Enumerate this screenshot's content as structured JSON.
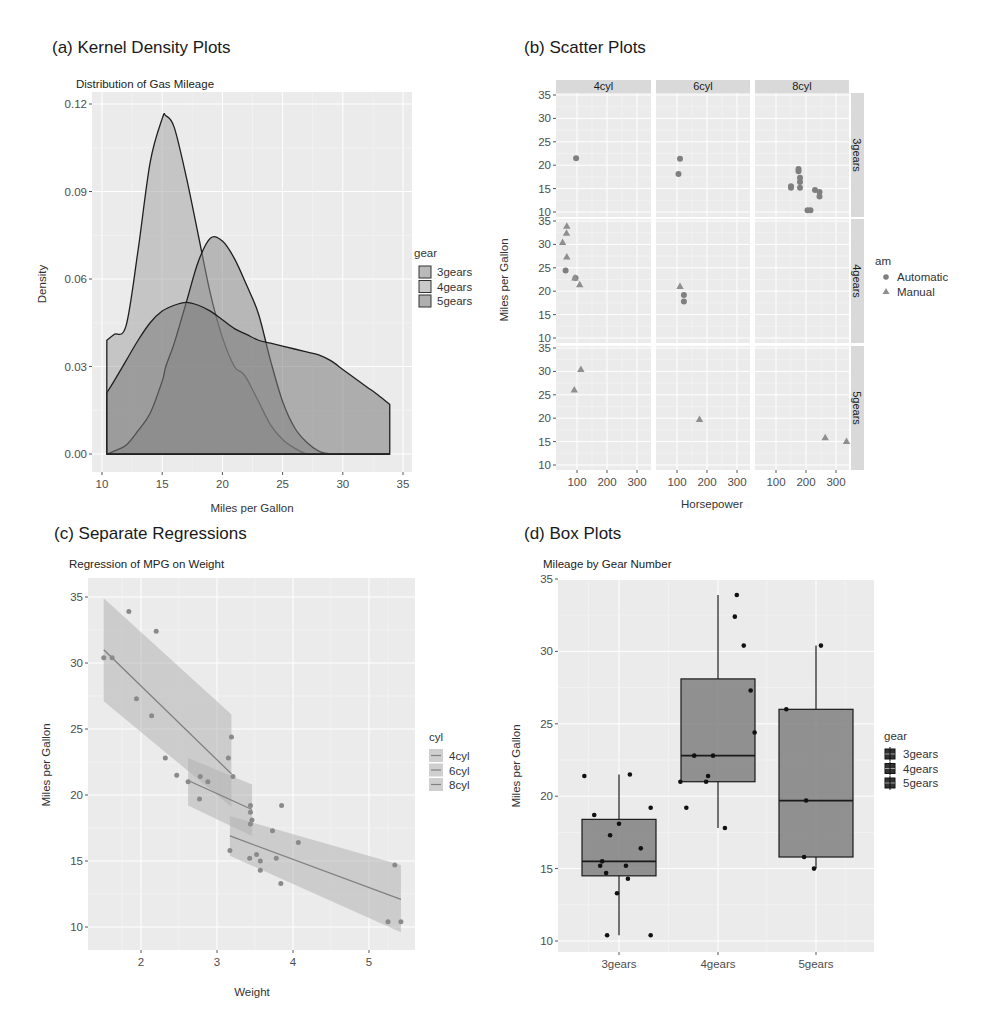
{
  "panels": {
    "a": {
      "label": "(a) Kernel Density Plots",
      "subtitle": "Distribution of Gas Mileage"
    },
    "b": {
      "label": "(b) Scatter Plots"
    },
    "c": {
      "label": "(c) Separate Regressions",
      "subtitle": "Regression of MPG on Weight"
    },
    "d": {
      "label": "(d) Box Plots",
      "subtitle": "Mileage by Gear Number"
    }
  },
  "colors": {
    "panel_bg": "#ebebeb",
    "grid": "#ffffff",
    "fill_3gears": "#8c8c8c",
    "fill_4gears": "#a6a6a6",
    "fill_5gears": "#7a7a7a",
    "point": "#7f7f7f",
    "box_fill": "#808080",
    "band": "#b3b3b3"
  },
  "chart_data": [
    {
      "id": "a",
      "type": "area",
      "title": "Distribution of Gas Mileage",
      "xlabel": "Miles per Gallon",
      "ylabel": "Density",
      "xlim": [
        10,
        35
      ],
      "ylim": [
        0,
        0.12
      ],
      "xticks": [
        10,
        15,
        20,
        25,
        30,
        35
      ],
      "yticks": [
        "0.00",
        "0.03",
        "0.06",
        "0.09",
        "0.12"
      ],
      "legend": {
        "title": "gear",
        "entries": [
          "3gears",
          "4gears",
          "5gears"
        ],
        "position": "right"
      },
      "series": [
        {
          "name": "3gears",
          "x": [
            10.4,
            11,
            12,
            13,
            14,
            15,
            15.3,
            16,
            17,
            18,
            19,
            20,
            21,
            22,
            23,
            24,
            25,
            26,
            27,
            28,
            29,
            30,
            31,
            32,
            33,
            33.9
          ],
          "y": [
            0,
            0.001,
            0.003,
            0.008,
            0.014,
            0.025,
            0.03,
            0.038,
            0.052,
            0.066,
            0.074,
            0.073,
            0.067,
            0.058,
            0.048,
            0.032,
            0.018,
            0.009,
            0.004,
            0.001,
            0,
            0,
            0,
            0,
            0,
            0
          ]
        },
        {
          "name": "4gears",
          "x": [
            10.4,
            11,
            12,
            13,
            14,
            15,
            15.3,
            16,
            17,
            18,
            19,
            20,
            21,
            21.6,
            22,
            23,
            24,
            25,
            26,
            27,
            28,
            29,
            30,
            31,
            32,
            33,
            33.9
          ],
          "y": [
            0.039,
            0.041,
            0.044,
            0.07,
            0.1,
            0.115,
            0.116,
            0.112,
            0.095,
            0.075,
            0.055,
            0.04,
            0.03,
            0.028,
            0.026,
            0.018,
            0.01,
            0.005,
            0.002,
            0,
            0,
            0,
            0,
            0,
            0,
            0,
            0
          ]
        },
        {
          "name": "5gears",
          "x": [
            10.4,
            11,
            12,
            13,
            14,
            15,
            16,
            17,
            18,
            19,
            20,
            21,
            22,
            23,
            24,
            25,
            26,
            27,
            28,
            29,
            30,
            31,
            32,
            33,
            33.9
          ],
          "y": [
            0.021,
            0.025,
            0.032,
            0.039,
            0.045,
            0.049,
            0.051,
            0.052,
            0.051,
            0.049,
            0.046,
            0.043,
            0.041,
            0.039,
            0.038,
            0.037,
            0.036,
            0.035,
            0.034,
            0.032,
            0.029,
            0.026,
            0.023,
            0.02,
            0.017
          ]
        }
      ],
      "overlay_curves": {
        "3gears_smooth_peak": {
          "x": 21.5,
          "y": 0.077
        },
        "4gears_peak": {
          "x": 15.3,
          "y": 0.116
        },
        "5gears_peak": {
          "x": 17.2,
          "y": 0.052
        }
      }
    },
    {
      "id": "b",
      "type": "scatter",
      "xlabel": "Horsepower",
      "ylabel": "Miles per Gallon",
      "xticks": [
        100,
        200,
        300
      ],
      "yticks": [
        10,
        15,
        20,
        25,
        30,
        35
      ],
      "facet_cols": [
        "4cyl",
        "6cyl",
        "8cyl"
      ],
      "facet_rows": [
        "3gears",
        "4gears",
        "5gears"
      ],
      "legend": {
        "title": "am",
        "entries": [
          "Automatic",
          "Manual"
        ],
        "position": "right"
      },
      "points": [
        {
          "cyl": "4cyl",
          "gear": "3gears",
          "hp": 97,
          "mpg": 21.5,
          "am": "Automatic"
        },
        {
          "cyl": "6cyl",
          "gear": "3gears",
          "hp": 110,
          "mpg": 21.4,
          "am": "Automatic"
        },
        {
          "cyl": "6cyl",
          "gear": "3gears",
          "hp": 105,
          "mpg": 18.1,
          "am": "Automatic"
        },
        {
          "cyl": "8cyl",
          "gear": "3gears",
          "hp": 175,
          "mpg": 18.7,
          "am": "Automatic"
        },
        {
          "cyl": "8cyl",
          "gear": "3gears",
          "hp": 175,
          "mpg": 19.2,
          "am": "Automatic"
        },
        {
          "cyl": "8cyl",
          "gear": "3gears",
          "hp": 180,
          "mpg": 17.3,
          "am": "Automatic"
        },
        {
          "cyl": "8cyl",
          "gear": "3gears",
          "hp": 180,
          "mpg": 16.4,
          "am": "Automatic"
        },
        {
          "cyl": "8cyl",
          "gear": "3gears",
          "hp": 180,
          "mpg": 15.2,
          "am": "Automatic"
        },
        {
          "cyl": "8cyl",
          "gear": "3gears",
          "hp": 150,
          "mpg": 15.5,
          "am": "Automatic"
        },
        {
          "cyl": "8cyl",
          "gear": "3gears",
          "hp": 150,
          "mpg": 15.2,
          "am": "Automatic"
        },
        {
          "cyl": "8cyl",
          "gear": "3gears",
          "hp": 205,
          "mpg": 10.4,
          "am": "Automatic"
        },
        {
          "cyl": "8cyl",
          "gear": "3gears",
          "hp": 215,
          "mpg": 10.4,
          "am": "Automatic"
        },
        {
          "cyl": "8cyl",
          "gear": "3gears",
          "hp": 230,
          "mpg": 14.7,
          "am": "Automatic"
        },
        {
          "cyl": "8cyl",
          "gear": "3gears",
          "hp": 245,
          "mpg": 14.3,
          "am": "Automatic"
        },
        {
          "cyl": "8cyl",
          "gear": "3gears",
          "hp": 245,
          "mpg": 13.3,
          "am": "Automatic"
        },
        {
          "cyl": "4cyl",
          "gear": "4gears",
          "hp": 62,
          "mpg": 24.4,
          "am": "Automatic"
        },
        {
          "cyl": "4cyl",
          "gear": "4gears",
          "hp": 95,
          "mpg": 22.8,
          "am": "Automatic"
        },
        {
          "cyl": "4cyl",
          "gear": "4gears",
          "hp": 66,
          "mpg": 33.9,
          "am": "Manual"
        },
        {
          "cyl": "4cyl",
          "gear": "4gears",
          "hp": 65,
          "mpg": 32.4,
          "am": "Manual"
        },
        {
          "cyl": "4cyl",
          "gear": "4gears",
          "hp": 52,
          "mpg": 30.4,
          "am": "Manual"
        },
        {
          "cyl": "4cyl",
          "gear": "4gears",
          "hp": 66,
          "mpg": 27.3,
          "am": "Manual"
        },
        {
          "cyl": "4cyl",
          "gear": "4gears",
          "hp": 93,
          "mpg": 22.8,
          "am": "Manual"
        },
        {
          "cyl": "4cyl",
          "gear": "4gears",
          "hp": 109,
          "mpg": 21.4,
          "am": "Manual"
        },
        {
          "cyl": "6cyl",
          "gear": "4gears",
          "hp": 110,
          "mpg": 21.0,
          "am": "Manual"
        },
        {
          "cyl": "6cyl",
          "gear": "4gears",
          "hp": 123,
          "mpg": 19.2,
          "am": "Automatic"
        },
        {
          "cyl": "6cyl",
          "gear": "4gears",
          "hp": 123,
          "mpg": 17.8,
          "am": "Automatic"
        },
        {
          "cyl": "4cyl",
          "gear": "5gears",
          "hp": 91,
          "mpg": 26.0,
          "am": "Manual"
        },
        {
          "cyl": "4cyl",
          "gear": "5gears",
          "hp": 113,
          "mpg": 30.4,
          "am": "Manual"
        },
        {
          "cyl": "6cyl",
          "gear": "5gears",
          "hp": 175,
          "mpg": 19.7,
          "am": "Manual"
        },
        {
          "cyl": "8cyl",
          "gear": "5gears",
          "hp": 264,
          "mpg": 15.8,
          "am": "Manual"
        },
        {
          "cyl": "8cyl",
          "gear": "5gears",
          "hp": 335,
          "mpg": 15.0,
          "am": "Manual"
        }
      ]
    },
    {
      "id": "c",
      "type": "scatter",
      "title": "Regression of MPG on Weight",
      "xlabel": "Weight",
      "ylabel": "Miles per Gallon",
      "xlim": [
        1.35,
        5.6
      ],
      "ylim": [
        8.3,
        36.2
      ],
      "xticks": [
        2,
        3,
        4,
        5
      ],
      "yticks": [
        10,
        15,
        20,
        25,
        30,
        35
      ],
      "legend": {
        "title": "cyl",
        "entries": [
          "4cyl",
          "6cyl",
          "8cyl"
        ],
        "position": "right"
      },
      "points": [
        {
          "wt": 1.51,
          "mpg": 30.4
        },
        {
          "wt": 1.62,
          "mpg": 30.4
        },
        {
          "wt": 1.84,
          "mpg": 33.9
        },
        {
          "wt": 1.94,
          "mpg": 27.3
        },
        {
          "wt": 2.14,
          "mpg": 26.0
        },
        {
          "wt": 2.2,
          "mpg": 32.4
        },
        {
          "wt": 2.32,
          "mpg": 22.8
        },
        {
          "wt": 2.47,
          "mpg": 21.5
        },
        {
          "wt": 3.15,
          "mpg": 22.8
        },
        {
          "wt": 3.19,
          "mpg": 24.4
        },
        {
          "wt": 3.21,
          "mpg": 21.4
        },
        {
          "wt": 2.62,
          "mpg": 21.0
        },
        {
          "wt": 2.77,
          "mpg": 19.7
        },
        {
          "wt": 2.78,
          "mpg": 21.4
        },
        {
          "wt": 2.88,
          "mpg": 21.0
        },
        {
          "wt": 3.44,
          "mpg": 19.2
        },
        {
          "wt": 3.44,
          "mpg": 18.7
        },
        {
          "wt": 3.46,
          "mpg": 18.1
        },
        {
          "wt": 3.44,
          "mpg": 17.8
        },
        {
          "wt": 3.17,
          "mpg": 15.8
        },
        {
          "wt": 3.43,
          "mpg": 15.2
        },
        {
          "wt": 3.52,
          "mpg": 15.5
        },
        {
          "wt": 3.57,
          "mpg": 15.0
        },
        {
          "wt": 3.57,
          "mpg": 14.3
        },
        {
          "wt": 3.73,
          "mpg": 17.3
        },
        {
          "wt": 3.78,
          "mpg": 15.2
        },
        {
          "wt": 3.84,
          "mpg": 13.3
        },
        {
          "wt": 3.85,
          "mpg": 19.2
        },
        {
          "wt": 4.07,
          "mpg": 16.4
        },
        {
          "wt": 5.25,
          "mpg": 10.4
        },
        {
          "wt": 5.34,
          "mpg": 14.7
        },
        {
          "wt": 5.42,
          "mpg": 10.4
        }
      ],
      "fits": [
        {
          "name": "4cyl",
          "x": [
            1.51,
            3.19
          ],
          "y": [
            31.0,
            21.6
          ],
          "band_lower": [
            27.1,
            19.1
          ],
          "band_upper": [
            34.9,
            26.1
          ]
        },
        {
          "name": "6cyl",
          "x": [
            2.62,
            3.46
          ],
          "y": [
            21.1,
            18.9
          ],
          "band_lower": [
            19.2,
            16.9
          ],
          "band_upper": [
            22.8,
            20.8
          ]
        },
        {
          "name": "8cyl",
          "x": [
            3.17,
            5.42
          ],
          "y": [
            16.9,
            12.1
          ],
          "band_lower": [
            15.4,
            9.6
          ],
          "band_upper": [
            18.4,
            14.7
          ]
        }
      ]
    },
    {
      "id": "d",
      "type": "box",
      "title": "Mileage by Gear Number",
      "xlabel": "",
      "ylabel": "Miles per Gallon",
      "ylim": [
        9.2,
        35.2
      ],
      "yticks": [
        10,
        15,
        20,
        25,
        30,
        35
      ],
      "categories": [
        "3gears",
        "4gears",
        "5gears"
      ],
      "legend": {
        "title": "gear",
        "entries": [
          "3gears",
          "4gears",
          "5gears"
        ],
        "position": "right"
      },
      "boxes": [
        {
          "name": "3gears",
          "min": 10.4,
          "q1": 14.5,
          "median": 15.5,
          "q3": 18.4,
          "max": 21.5
        },
        {
          "name": "4gears",
          "min": 17.8,
          "q1": 21.0,
          "median": 22.8,
          "q3": 28.1,
          "max": 33.9
        },
        {
          "name": "5gears",
          "min": 15.0,
          "q1": 15.8,
          "median": 19.7,
          "q3": 26.0,
          "max": 30.4
        }
      ],
      "jitter_points": [
        {
          "cat": 0,
          "dx": -0.35,
          "mpg": 21.4
        },
        {
          "cat": 0,
          "dx": -0.25,
          "mpg": 18.7
        },
        {
          "cat": 0,
          "dx": -0.09,
          "mpg": 17.3
        },
        {
          "cat": 0,
          "dx": 0.0,
          "mpg": 18.1
        },
        {
          "cat": 0,
          "dx": 0.11,
          "mpg": 21.5
        },
        {
          "cat": 0,
          "dx": 0.32,
          "mpg": 19.2
        },
        {
          "cat": 0,
          "dx": 0.22,
          "mpg": 16.4
        },
        {
          "cat": 0,
          "dx": -0.17,
          "mpg": 15.5
        },
        {
          "cat": 0,
          "dx": -0.19,
          "mpg": 15.2
        },
        {
          "cat": 0,
          "dx": 0.07,
          "mpg": 15.2
        },
        {
          "cat": 0,
          "dx": -0.13,
          "mpg": 14.7
        },
        {
          "cat": 0,
          "dx": 0.09,
          "mpg": 14.3
        },
        {
          "cat": 0,
          "dx": -0.02,
          "mpg": 13.3
        },
        {
          "cat": 0,
          "dx": -0.12,
          "mpg": 10.4
        },
        {
          "cat": 0,
          "dx": 0.32,
          "mpg": 10.4
        },
        {
          "cat": 1,
          "dx": 0.19,
          "mpg": 33.9
        },
        {
          "cat": 1,
          "dx": 0.17,
          "mpg": 32.4
        },
        {
          "cat": 1,
          "dx": 0.26,
          "mpg": 30.4
        },
        {
          "cat": 1,
          "dx": 0.33,
          "mpg": 27.3
        },
        {
          "cat": 1,
          "dx": 0.37,
          "mpg": 24.4
        },
        {
          "cat": 1,
          "dx": -0.24,
          "mpg": 22.8
        },
        {
          "cat": 1,
          "dx": -0.05,
          "mpg": 22.8
        },
        {
          "cat": 1,
          "dx": -0.1,
          "mpg": 21.4
        },
        {
          "cat": 1,
          "dx": -0.38,
          "mpg": 21.0
        },
        {
          "cat": 1,
          "dx": -0.12,
          "mpg": 21.0
        },
        {
          "cat": 1,
          "dx": -0.32,
          "mpg": 19.2
        },
        {
          "cat": 1,
          "dx": 0.07,
          "mpg": 17.8
        },
        {
          "cat": 2,
          "dx": 0.05,
          "mpg": 30.4
        },
        {
          "cat": 2,
          "dx": -0.3,
          "mpg": 26.0
        },
        {
          "cat": 2,
          "dx": -0.1,
          "mpg": 19.7
        },
        {
          "cat": 2,
          "dx": -0.12,
          "mpg": 15.8
        },
        {
          "cat": 2,
          "dx": -0.02,
          "mpg": 15.0
        }
      ]
    }
  ]
}
